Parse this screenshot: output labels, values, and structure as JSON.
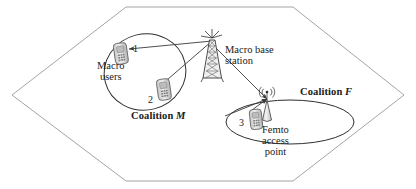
{
  "diagram": {
    "cell": {
      "shape": "hexagon",
      "name": "macro-cell-hexagon"
    },
    "nodes": [
      {
        "id": "1",
        "type": "mobile-phone",
        "label": "1",
        "coalition": "M"
      },
      {
        "id": "2",
        "type": "mobile-phone",
        "label": "2",
        "coalition": "M"
      },
      {
        "id": "3",
        "type": "mobile-phone",
        "label": "3",
        "coalition": "F"
      }
    ],
    "labels": {
      "macro_users": "Macro\nusers",
      "macro_users_line1": "Macro",
      "macro_users_line2": "users",
      "macro_base_station_line1": "Macro base",
      "macro_base_station_line2": "station",
      "femto_line1": "Femto",
      "femto_line2": "access",
      "femto_line3": "point",
      "coalition_m_word": "Coalition",
      "coalition_m_symbol": "M",
      "coalition_f_word": "Coalition",
      "coalition_f_symbol": "F"
    },
    "links": [
      {
        "from": "macro-base-station",
        "to": "1",
        "style": "arrow"
      },
      {
        "from": "macro-base-station",
        "to": "2",
        "style": "arrow"
      },
      {
        "from": "macro-base-station",
        "to": "femto-access-point",
        "style": "arrow"
      },
      {
        "from": "3",
        "to": "femto-access-point",
        "style": "arrow"
      }
    ],
    "colors": {
      "line": "#404040",
      "cell_border": "#8f8f8f",
      "text": "#1a1a1a",
      "device_fill": "#d8d8d8",
      "device_stroke": "#555555",
      "background": "#ffffff"
    }
  }
}
